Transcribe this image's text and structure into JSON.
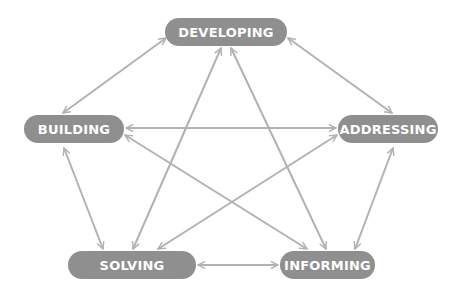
{
  "colors": {
    "node_fill": "#8f8f8f",
    "node_text": "#ffffff",
    "edge": "#b2b2b2",
    "background": "#ffffff"
  },
  "nodes": [
    {
      "id": "developing",
      "label": "DEVELOPING",
      "x": 165,
      "y": 18,
      "w": 122
    },
    {
      "id": "building",
      "label": "BUILDING",
      "x": 24,
      "y": 115,
      "w": 100
    },
    {
      "id": "addressing",
      "label": "ADDRESSING",
      "x": 338,
      "y": 115,
      "w": 100
    },
    {
      "id": "solving",
      "label": "SOLVING",
      "x": 68,
      "y": 251,
      "w": 128
    },
    {
      "id": "informing",
      "label": "INFORMING",
      "x": 280,
      "y": 251,
      "w": 95
    }
  ],
  "edges": [
    {
      "from": "building",
      "to": "developing",
      "x1": 63,
      "y1": 113,
      "x2": 166,
      "y2": 38,
      "bidirectional": true
    },
    {
      "from": "developing",
      "to": "addressing",
      "x1": 288,
      "y1": 38,
      "x2": 392,
      "y2": 113,
      "bidirectional": true
    },
    {
      "from": "building",
      "to": "addressing",
      "x1": 126,
      "y1": 128,
      "x2": 336,
      "y2": 128,
      "bidirectional": true
    },
    {
      "from": "building",
      "to": "solving",
      "x1": 64,
      "y1": 148,
      "x2": 103,
      "y2": 249,
      "bidirectional": true
    },
    {
      "from": "addressing",
      "to": "informing",
      "x1": 393,
      "y1": 148,
      "x2": 355,
      "y2": 249,
      "bidirectional": true
    },
    {
      "from": "solving",
      "to": "informing",
      "x1": 198,
      "y1": 265,
      "x2": 278,
      "y2": 265,
      "bidirectional": true
    },
    {
      "from": "developing",
      "to": "solving",
      "x1": 221,
      "y1": 48,
      "x2": 133,
      "y2": 249,
      "bidirectional": true
    },
    {
      "from": "developing",
      "to": "informing",
      "x1": 231,
      "y1": 48,
      "x2": 326,
      "y2": 249,
      "bidirectional": true
    },
    {
      "from": "building",
      "to": "informing",
      "x1": 125,
      "y1": 135,
      "x2": 307,
      "y2": 249,
      "bidirectional": true
    },
    {
      "from": "addressing",
      "to": "solving",
      "x1": 337,
      "y1": 135,
      "x2": 158,
      "y2": 249,
      "bidirectional": true
    }
  ]
}
